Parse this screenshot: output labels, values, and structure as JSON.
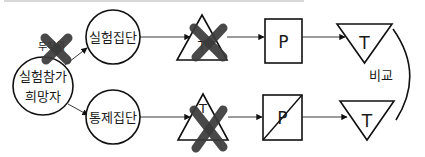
{
  "diagram": {
    "participants": {
      "label_line1": "실험참가",
      "label_line2": "희망자"
    },
    "randomization": {
      "label": "무작위",
      "crossed_out": true
    },
    "experimental_group": {
      "label": "실험집단",
      "pretest": {
        "label": "T",
        "crossed_out": true
      },
      "treatment": {
        "label": "P",
        "slashed": false
      },
      "posttest": {
        "label": "T"
      }
    },
    "control_group": {
      "label": "통제집단",
      "pretest": {
        "label": "T",
        "crossed_out": true
      },
      "treatment": {
        "label": "P",
        "slashed": true
      },
      "posttest": {
        "label": "T"
      }
    },
    "comparison": {
      "label": "비교"
    },
    "colors": {
      "stroke": "#111111",
      "xmark": "#3a3a3a",
      "background": "#ffffff"
    }
  }
}
